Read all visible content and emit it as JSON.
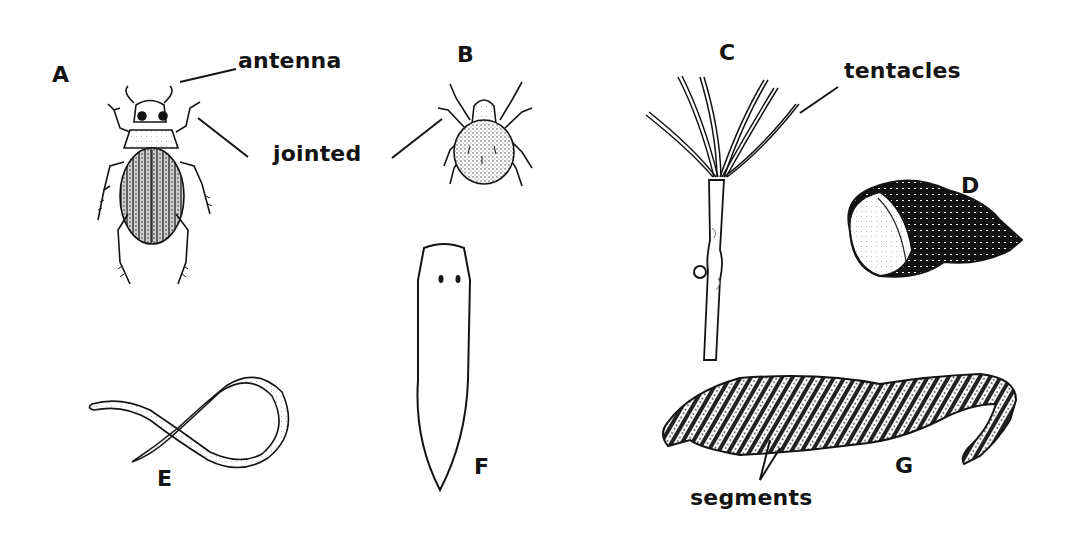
{
  "diagram": {
    "type": "labeled-specimen-illustration",
    "background": "#ffffff",
    "ink_color": "#141414",
    "specimens": [
      {
        "id": "A",
        "letter": "A",
        "depiction": "beetle (insect)",
        "callouts": [
          "antenna",
          "jointed"
        ]
      },
      {
        "id": "B",
        "letter": "B",
        "depiction": "mite (arachnid)",
        "callouts": [
          "jointed"
        ]
      },
      {
        "id": "C",
        "letter": "C",
        "depiction": "hydra on stalk",
        "callouts": [
          "tentacles"
        ]
      },
      {
        "id": "D",
        "letter": "D",
        "depiction": "snail shell"
      },
      {
        "id": "E",
        "letter": "E",
        "depiction": "roundworm (looped)"
      },
      {
        "id": "F",
        "letter": "F",
        "depiction": "flatworm (planarian)"
      },
      {
        "id": "G",
        "letter": "G",
        "depiction": "segmented worm (leech/earthworm)",
        "callouts": [
          "segments"
        ]
      }
    ],
    "terms": {
      "antenna": "antenna",
      "jointed": "jointed",
      "tentacles": "tentacles",
      "segments": "segments"
    }
  }
}
